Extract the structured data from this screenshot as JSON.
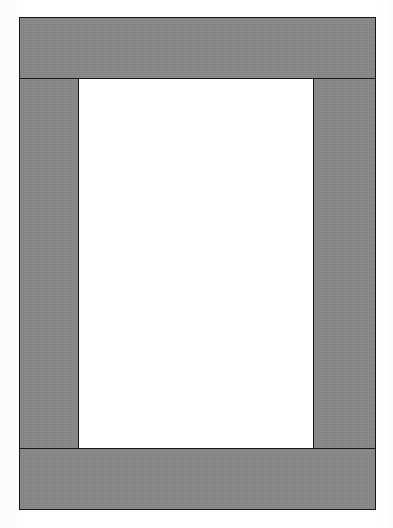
{
  "document": {
    "title": "Rectangular Frame Border Figure",
    "canvas_width": 393,
    "canvas_height": 528,
    "background_color": "#ffffff"
  },
  "figure": {
    "type": "frame-border-rectangle",
    "outer_rect": {
      "x": 19,
      "y": 17,
      "width": 357,
      "height": 493
    },
    "inner_rect": {
      "x": 79,
      "y": 79,
      "width": 234,
      "height": 369
    },
    "fill_color": "#878787",
    "stroke_color": "#171717",
    "stroke_width": 1.5,
    "inner_fill_color": "#ffffff",
    "bands": [
      {
        "id": "band-top",
        "label": "Top border band",
        "orientation": "horizontal",
        "x": 19,
        "y": 17,
        "width": 357,
        "height": 62
      },
      {
        "id": "band-left",
        "label": "Left border band",
        "orientation": "vertical",
        "x": 19,
        "y": 78,
        "width": 60,
        "height": 371
      },
      {
        "id": "band-right",
        "label": "Right border band",
        "orientation": "vertical",
        "x": 313,
        "y": 78,
        "width": 63,
        "height": 371
      },
      {
        "id": "band-bottom",
        "label": "Bottom border band",
        "orientation": "horizontal",
        "x": 19,
        "y": 448,
        "width": 357,
        "height": 62
      }
    ],
    "inner_panel": {
      "id": "inner-panel",
      "label": "Inner blank panel",
      "content": ""
    }
  }
}
